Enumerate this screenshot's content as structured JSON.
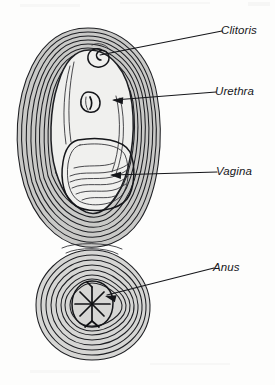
{
  "figure": {
    "style": "black and white line drawing with concentric contour shading",
    "background_color": "#fdfdfc",
    "line_color": "#15161a",
    "shade_color": "#c9c9c7"
  },
  "labels": [
    {
      "id": "clitoris",
      "text": "Clitoris",
      "text_x": 221,
      "text_y": 34,
      "leader": "M 100 55 L 222 31",
      "has_arrowhead": false,
      "arrow_x": 100,
      "arrow_y": 55,
      "arrow_angle": 169
    },
    {
      "id": "urethra",
      "text": "Urethra",
      "text_x": 215,
      "text_y": 95,
      "leader": "M 114 100 L 216 92",
      "has_arrowhead": true,
      "arrow_x": 112,
      "arrow_y": 100,
      "arrow_angle": 184
    },
    {
      "id": "vagina",
      "text": "Vagina",
      "text_x": 216,
      "text_y": 175,
      "leader": "M 112 175 L 217 172",
      "has_arrowhead": true,
      "arrow_x": 110,
      "arrow_y": 175,
      "arrow_angle": 182
    },
    {
      "id": "anus",
      "text": "Anus",
      "text_x": 213,
      "text_y": 271,
      "leader": "M 107 295 L 214 268",
      "has_arrowhead": true,
      "arrow_x": 105,
      "arrow_y": 296,
      "arrow_angle": 194
    }
  ],
  "structures": [
    {
      "id": "labia-contours",
      "name": "Labia majora contour rings",
      "ring_count": 11
    },
    {
      "id": "vestibule",
      "name": "Vestibule / inner region"
    },
    {
      "id": "clitoris-organ",
      "name": "Clitoris",
      "shape": "small spiral ring"
    },
    {
      "id": "urethra-organ",
      "name": "Urethral opening",
      "shape": "small oval"
    },
    {
      "id": "vagina-organ",
      "name": "Vaginal opening",
      "shape": "rounded rectangle with rugae folds"
    },
    {
      "id": "anus-contours",
      "name": "Anal contour rings",
      "ring_count": 9
    },
    {
      "id": "anus-organ",
      "name": "Anus",
      "shape": "oval with radiating star folds"
    }
  ]
}
